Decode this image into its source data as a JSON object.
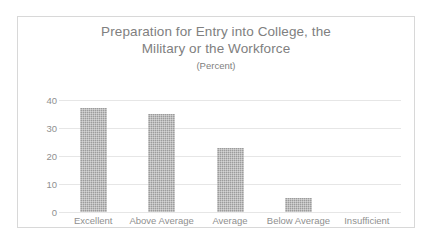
{
  "scan_artifact": {
    "top_cut_text": "· · · ·"
  },
  "chart_data": {
    "type": "bar",
    "title": "Preparation for Entry into College, the Military or the Workforce",
    "title_line1": "Preparation for Entry into College, the",
    "title_line2": "Military or the Workforce",
    "subtitle": "(Percent)",
    "xlabel": "",
    "ylabel": "",
    "ylim": [
      0,
      40
    ],
    "ytick_values": [
      40,
      30,
      20,
      10,
      0
    ],
    "ytick_labels": [
      "40",
      "30",
      "20",
      "10",
      "0"
    ],
    "grid": true,
    "legend": false,
    "legend_position": "none",
    "categories": [
      "Excellent",
      "Above Average",
      "Average",
      "Below Average",
      "Insufficient"
    ],
    "values": [
      37,
      35,
      23,
      5,
      0
    ],
    "colors": {
      "bar_fill": "#9c9c9c",
      "gridline": "#e6e6e6",
      "text": "#8f8f8f",
      "title_text": "#808080",
      "frame_border": "#d8d8d8",
      "background": "#ffffff"
    }
  }
}
